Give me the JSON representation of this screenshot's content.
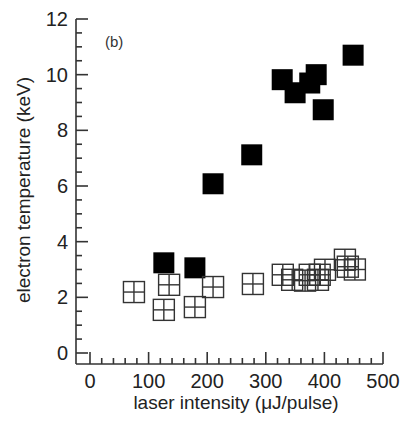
{
  "chart_data": {
    "type": "scatter",
    "title": "",
    "panel_label": "(b)",
    "xlabel": "laser intensity  (μJ/pulse)",
    "ylabel": "electron temperature (keV)",
    "xlim": [
      -30,
      500
    ],
    "ylim": [
      -0.3,
      12
    ],
    "xticks": [
      0,
      100,
      200,
      300,
      400,
      500
    ],
    "yticks": [
      0,
      2,
      4,
      6,
      8,
      10,
      12
    ],
    "grid": false,
    "legend": null,
    "series": [
      {
        "name": "hot component",
        "marker": "filled-square",
        "color": "#000000",
        "points": [
          {
            "x": 126,
            "y": 3.24
          },
          {
            "x": 179,
            "y": 3.06
          },
          {
            "x": 210,
            "y": 6.08
          },
          {
            "x": 276,
            "y": 7.12
          },
          {
            "x": 328,
            "y": 9.82
          },
          {
            "x": 350,
            "y": 9.35
          },
          {
            "x": 375,
            "y": 9.7
          },
          {
            "x": 386,
            "y": 10.0
          },
          {
            "x": 398,
            "y": 8.74
          },
          {
            "x": 449,
            "y": 10.7
          }
        ]
      },
      {
        "name": "cold component",
        "marker": "open-square-cross",
        "color": "#333333",
        "points": [
          {
            "x": 75,
            "y": 2.19
          },
          {
            "x": 126,
            "y": 1.55
          },
          {
            "x": 135,
            "y": 2.45
          },
          {
            "x": 179,
            "y": 1.65
          },
          {
            "x": 210,
            "y": 2.37
          },
          {
            "x": 278,
            "y": 2.48
          },
          {
            "x": 329,
            "y": 2.81
          },
          {
            "x": 345,
            "y": 2.63
          },
          {
            "x": 367,
            "y": 2.6
          },
          {
            "x": 375,
            "y": 2.81
          },
          {
            "x": 389,
            "y": 2.63
          },
          {
            "x": 392,
            "y": 2.81
          },
          {
            "x": 401,
            "y": 2.99
          },
          {
            "x": 435,
            "y": 3.35
          },
          {
            "x": 440,
            "y": 3.1
          },
          {
            "x": 452,
            "y": 3.0
          }
        ]
      }
    ]
  }
}
